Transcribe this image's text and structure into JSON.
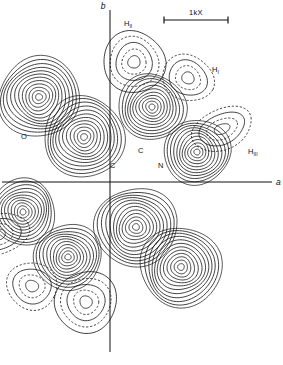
{
  "figure": {
    "type": "electron-density-contour-map",
    "title": "",
    "background_color": "#ffffff",
    "line_color": "#111111",
    "width": 283,
    "height": 365
  },
  "axes": {
    "vertical": {
      "label": "b",
      "x": 110,
      "y_top": 10,
      "y_bottom": 352
    },
    "horizontal": {
      "label": "a",
      "y": 182,
      "x_left": 2,
      "x_right": 272
    }
  },
  "scale_bar": {
    "label": "1kX",
    "x_start": 164,
    "x_end": 228,
    "y": 20
  },
  "atom_labels": [
    {
      "name": "O",
      "base": "O",
      "sub": "",
      "x": 21,
      "y": 139
    },
    {
      "name": "C-left",
      "base": "C",
      "sub": "",
      "x": 110,
      "y": 168
    },
    {
      "name": "C-mid",
      "base": "C",
      "sub": "",
      "x": 138,
      "y": 153
    },
    {
      "name": "N",
      "base": "N",
      "sub": "",
      "x": 158,
      "y": 168
    },
    {
      "name": "H-I",
      "base": "H",
      "sub": "I",
      "x": 212,
      "y": 72
    },
    {
      "name": "H-II",
      "base": "H",
      "sub": "II",
      "x": 124,
      "y": 26
    },
    {
      "name": "H-III",
      "base": "H",
      "sub": "III",
      "x": 248,
      "y": 154
    }
  ],
  "contour_style": {
    "heavy_atom": "solid dense rings",
    "hydrogen_atom": "alternating solid and dashed sparse rings",
    "dash_pattern": "2.2 1.8"
  },
  "chart_data": {
    "type": "contour",
    "title": "",
    "xlabel": "a",
    "ylabel": "b",
    "grid": false,
    "legend": null,
    "symmetry": "inversion through origin",
    "origin": {
      "x": 110,
      "y": 182
    },
    "peaks": [
      {
        "label": "O",
        "cx": 39,
        "cy": 97,
        "rx": 41,
        "ry": 40,
        "rings": 12,
        "style": "solid",
        "rot": -18
      },
      {
        "label": "C",
        "cx": 84,
        "cy": 137,
        "rx": 41,
        "ry": 40,
        "rings": 12,
        "style": "solid",
        "rot": -12
      },
      {
        "label": "C",
        "cx": 152,
        "cy": 107,
        "rx": 34,
        "ry": 33,
        "rings": 11,
        "style": "solid",
        "rot": 0
      },
      {
        "label": "N",
        "cx": 197,
        "cy": 152,
        "rx": 33,
        "ry": 33,
        "rings": 11,
        "style": "solid",
        "rot": 0
      },
      {
        "label": "H-II",
        "cx": 134,
        "cy": 62,
        "rx": 31,
        "ry": 31,
        "rings": 5,
        "style": "alt",
        "rot": 0
      },
      {
        "label": "H-I",
        "cx": 188,
        "cy": 78,
        "rx": 26,
        "ry": 23,
        "rings": 4,
        "style": "alt",
        "rot": 25
      },
      {
        "label": "H-III",
        "cx": 222,
        "cy": 129,
        "rx": 32,
        "ry": 20,
        "rings": 4,
        "style": "alt",
        "rot": -22
      },
      {
        "label": "O'",
        "cx": 181,
        "cy": 267,
        "rx": 41,
        "ry": 40,
        "rings": 12,
        "style": "solid",
        "rot": -18
      },
      {
        "label": "C'",
        "cx": 136,
        "cy": 227,
        "rx": 41,
        "ry": 40,
        "rings": 12,
        "style": "solid",
        "rot": -12
      },
      {
        "label": "C''",
        "cx": 68,
        "cy": 257,
        "rx": 34,
        "ry": 33,
        "rings": 11,
        "style": "solid",
        "rot": 0
      },
      {
        "label": "N'",
        "cx": 23,
        "cy": 212,
        "rx": 33,
        "ry": 33,
        "rings": 11,
        "style": "solid",
        "rot": 0
      },
      {
        "label": "H-II'",
        "cx": 86,
        "cy": 302,
        "rx": 31,
        "ry": 31,
        "rings": 5,
        "style": "alt",
        "rot": 0
      },
      {
        "label": "H-I'",
        "cx": 32,
        "cy": 286,
        "rx": 26,
        "ry": 23,
        "rings": 4,
        "style": "alt",
        "rot": 25
      },
      {
        "label": "H-III'",
        "cx": -2,
        "cy": 235,
        "rx": 32,
        "ry": 20,
        "rings": 4,
        "style": "alt",
        "rot": -22
      }
    ]
  }
}
